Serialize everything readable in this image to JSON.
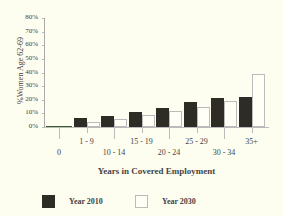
{
  "chart_data": {
    "type": "bar",
    "title": "",
    "xlabel": "Years in Covered Employment",
    "ylabel": "%Women Age 62-69",
    "ylim": [
      0,
      80
    ],
    "yticks": [
      "0%",
      "10%",
      "20%",
      "30%",
      "40%",
      "50%",
      "60%",
      "70%",
      "80%"
    ],
    "categories": [
      "0",
      "1 - 9",
      "10 - 14",
      "15 - 19",
      "20 - 24",
      "25 - 29",
      "30 - 34",
      "35+"
    ],
    "series": [
      {
        "name": "Year 2010",
        "color": "#2e2c24",
        "values": [
          0.5,
          6.5,
          8,
          11,
          14,
          18,
          21,
          22
        ]
      },
      {
        "name": "Year 2030",
        "color": "#fffff6",
        "values": [
          0.5,
          4,
          6,
          9,
          12,
          15,
          19,
          39
        ]
      }
    ],
    "grid": false,
    "legend_position": "bottom"
  }
}
